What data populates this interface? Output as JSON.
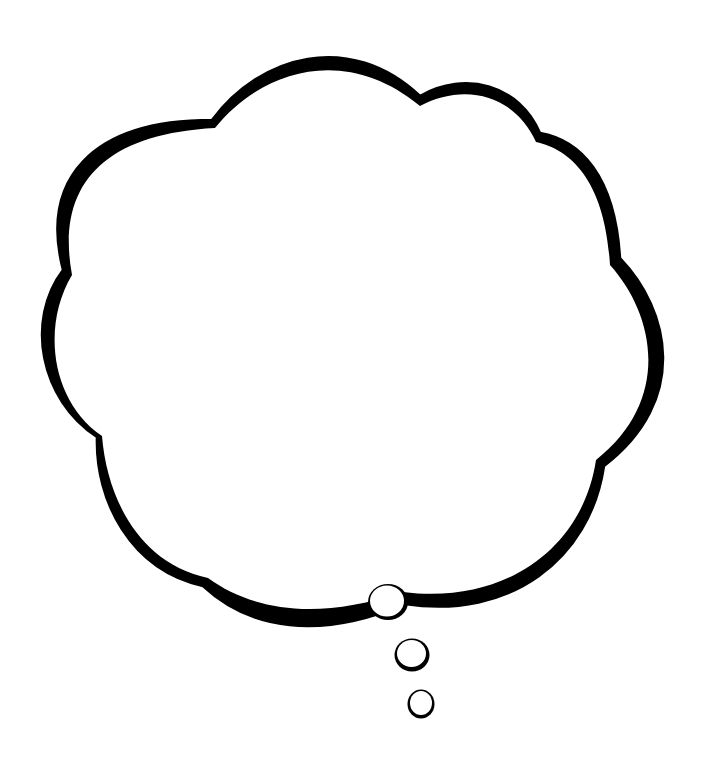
{
  "image": {
    "subject": "thought bubble",
    "background_color": "#ffffff",
    "ink_color": "#000000",
    "fill_color": "#ffffff"
  },
  "cloud": {
    "label": "Thought bubble cloud",
    "lobes": 9
  },
  "trail_bubbles": [
    {
      "label": "large trail bubble",
      "cx": 388,
      "cy": 602,
      "rx": 19,
      "ry": 17
    },
    {
      "label": "medium trail bubble",
      "cx": 412,
      "cy": 655,
      "rx": 17,
      "ry": 16
    },
    {
      "label": "small trail bubble",
      "cx": 421,
      "cy": 704,
      "rx": 13,
      "ry": 14
    }
  ]
}
